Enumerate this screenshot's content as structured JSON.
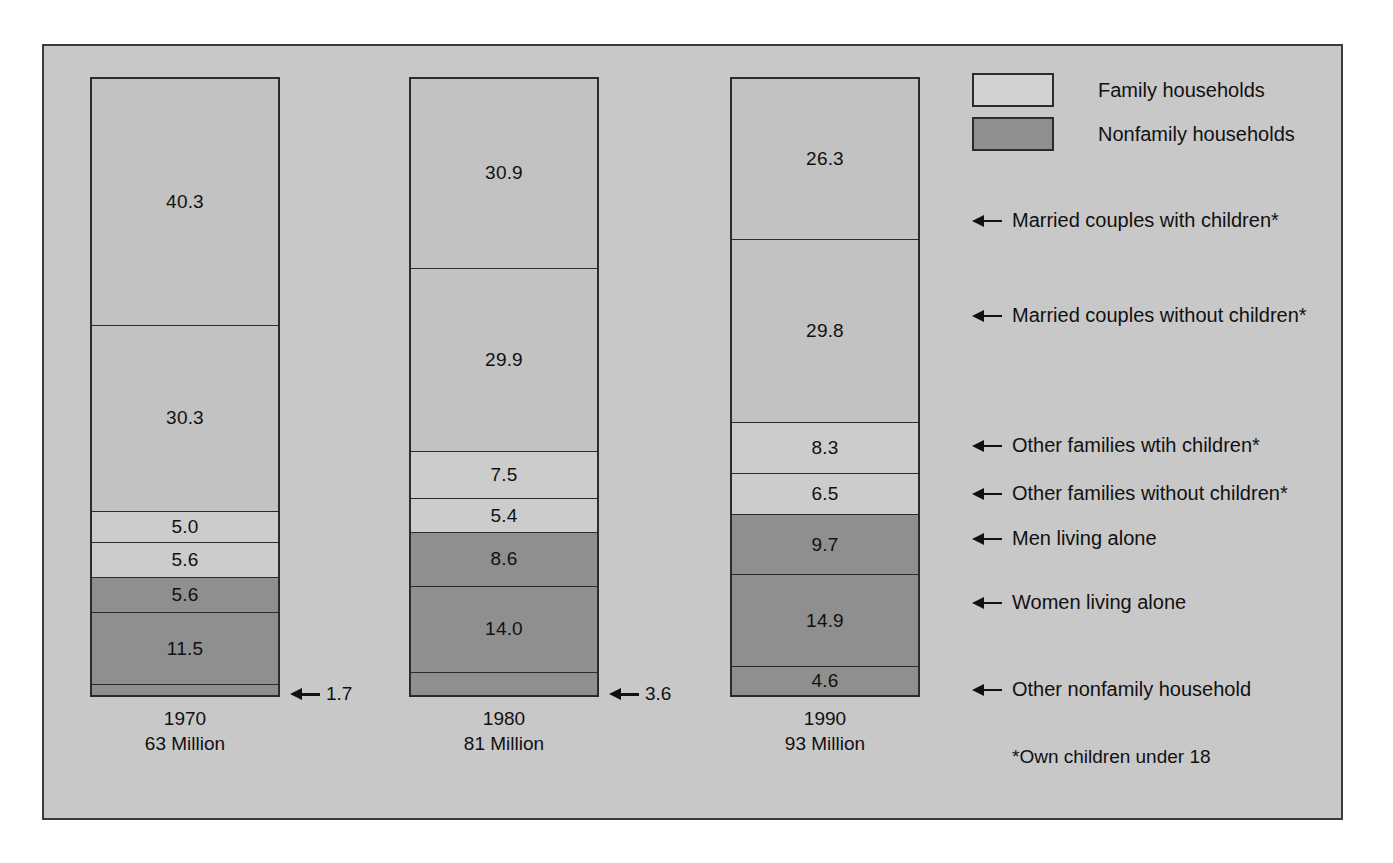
{
  "chart_data": {
    "type": "bar",
    "subtype": "100% stacked vertical bar",
    "title": "",
    "xlabel": "",
    "ylabel": "",
    "value_unit": "percent of households",
    "grid": false,
    "legend_position": "top-right",
    "categories": [
      "1970",
      "1980",
      "1990"
    ],
    "category_sublabels": [
      "63 Million",
      "81 Million",
      "93 Million"
    ],
    "series": [
      {
        "name": "Married couples with children*",
        "group": "Family households",
        "values": [
          40.3,
          30.9,
          26.3
        ]
      },
      {
        "name": "Married couples without children*",
        "group": "Family households",
        "values": [
          30.3,
          29.9,
          29.8
        ]
      },
      {
        "name": "Other families wtih children*",
        "group": "Family households",
        "values": [
          5.0,
          7.5,
          8.3
        ]
      },
      {
        "name": "Other families without children*",
        "group": "Family households",
        "values": [
          5.6,
          5.4,
          6.5
        ]
      },
      {
        "name": "Men living alone",
        "group": "Nonfamily households",
        "values": [
          5.6,
          8.6,
          9.7
        ]
      },
      {
        "name": "Women living alone",
        "group": "Nonfamily households",
        "values": [
          11.5,
          14.0,
          14.9
        ]
      },
      {
        "name": "Other nonfamily household",
        "group": "Nonfamily households",
        "values": [
          1.7,
          3.6,
          4.6
        ]
      }
    ],
    "annotations": [
      "*Own children under 18"
    ]
  },
  "colors": {
    "panel_background": "#c8c8c8",
    "panel_border": "#3a3a3a",
    "family_fill": "#c2c2c2",
    "family_fill_light": "#cccccc",
    "nonfamily_fill": "#8f8f8f",
    "segment_border": "#2b2b2b",
    "text": "#111111"
  },
  "legend": {
    "items": [
      {
        "label": "Family households",
        "swatch": "family"
      },
      {
        "label": "Nonfamily households",
        "swatch": "nonfamily"
      }
    ]
  },
  "bars": {
    "1970": {
      "year_label": "1970",
      "total_label": "63 Million",
      "segments": [
        {
          "value": "40.3",
          "pct": 40.3,
          "type": "family"
        },
        {
          "value": "30.3",
          "pct": 30.3,
          "type": "family"
        },
        {
          "value": "5.0",
          "pct": 5.0,
          "type": "family-lite"
        },
        {
          "value": "5.6",
          "pct": 5.6,
          "type": "family-lite"
        },
        {
          "value": "5.6",
          "pct": 5.6,
          "type": "nonfamily"
        },
        {
          "value": "11.5",
          "pct": 11.5,
          "type": "nonfamily"
        },
        {
          "value": "",
          "pct": 1.7,
          "type": "nonfamily"
        }
      ],
      "callout": "1.7"
    },
    "1980": {
      "year_label": "1980",
      "total_label": "81 Million",
      "segments": [
        {
          "value": "30.9",
          "pct": 30.9,
          "type": "family"
        },
        {
          "value": "29.9",
          "pct": 29.9,
          "type": "family"
        },
        {
          "value": "7.5",
          "pct": 7.5,
          "type": "family-lite"
        },
        {
          "value": "5.4",
          "pct": 5.4,
          "type": "family-lite"
        },
        {
          "value": "8.6",
          "pct": 8.6,
          "type": "nonfamily"
        },
        {
          "value": "14.0",
          "pct": 14.0,
          "type": "nonfamily"
        },
        {
          "value": "",
          "pct": 3.6,
          "type": "nonfamily"
        }
      ],
      "callout": "3.6"
    },
    "1990": {
      "year_label": "1990",
      "total_label": "93 Million",
      "segments": [
        {
          "value": "26.3",
          "pct": 26.3,
          "type": "family"
        },
        {
          "value": "29.8",
          "pct": 29.8,
          "type": "family"
        },
        {
          "value": "8.3",
          "pct": 8.3,
          "type": "family-lite"
        },
        {
          "value": "6.5",
          "pct": 6.5,
          "type": "family-lite"
        },
        {
          "value": "9.7",
          "pct": 9.7,
          "type": "nonfamily"
        },
        {
          "value": "14.9",
          "pct": 14.9,
          "type": "nonfamily"
        },
        {
          "value": "4.6",
          "pct": 4.6,
          "type": "nonfamily"
        }
      ],
      "callout": ""
    }
  },
  "annotations": [
    {
      "label": "Married couples with children*",
      "top": 163
    },
    {
      "label": "Married couples without children*",
      "top": 258
    },
    {
      "label": "Other families wtih children*",
      "top": 388
    },
    {
      "label": "Other families without children*",
      "top": 436
    },
    {
      "label": "Men living alone",
      "top": 481
    },
    {
      "label": "Women living alone",
      "top": 545
    },
    {
      "label": "Other nonfamily household",
      "top": 632
    }
  ],
  "footnote": "*Own children under 18"
}
